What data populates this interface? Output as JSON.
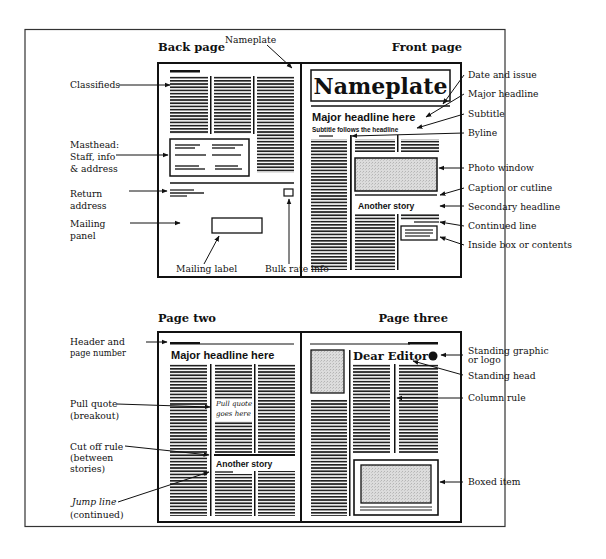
{
  "spread_top": {
    "left_title": "Back page",
    "right_title": "Front page",
    "nameplate_callout": "Nameplate",
    "nameplate_text": "Nameplate",
    "major_headline": "Major headline here",
    "subtitle_text": "Subtitle follows the headline",
    "secondary_story": "Another story",
    "left_labels": [
      {
        "lines": [
          "Classifieds"
        ]
      },
      {
        "lines": [
          "Masthead:",
          "Staff, info",
          "& address"
        ]
      },
      {
        "lines": [
          "Return",
          "address"
        ]
      },
      {
        "lines": [
          "Mailing",
          "panel"
        ]
      }
    ],
    "right_labels": [
      "Date and issue",
      "Major headline",
      "Subtitle",
      "Byline",
      "Photo window",
      "Caption or cutline",
      "Secondary headline",
      "Continued line",
      "Inside box or contents"
    ],
    "bottom_labels": [
      "Mailing label",
      "Bulk rate info"
    ]
  },
  "spread_bottom": {
    "left_title": "Page two",
    "right_title": "Page three",
    "major_headline": "Major headline here",
    "pull_quote": [
      "Pull quote",
      "goes here"
    ],
    "secondary_story": "Another story",
    "standing_head": "Dear Editor",
    "left_labels": [
      {
        "lines": [
          "Header and",
          "page number"
        ]
      },
      {
        "lines": [
          "Pull quote",
          "(breakout)"
        ]
      },
      {
        "lines": [
          "Cut off rule",
          "(between",
          "stories)"
        ]
      },
      {
        "lines": [
          "Jump line",
          "(continued)"
        ]
      }
    ],
    "right_labels": [
      {
        "lines": [
          "Standing graphic",
          "or logo"
        ]
      },
      {
        "lines": [
          "Standing head"
        ]
      },
      {
        "lines": [
          "Column rule"
        ]
      },
      {
        "lines": [
          "Boxed item"
        ]
      }
    ]
  },
  "colors": {
    "ink": "#111111",
    "photo_fill": "#d4d4d4",
    "background": "#ffffff"
  }
}
